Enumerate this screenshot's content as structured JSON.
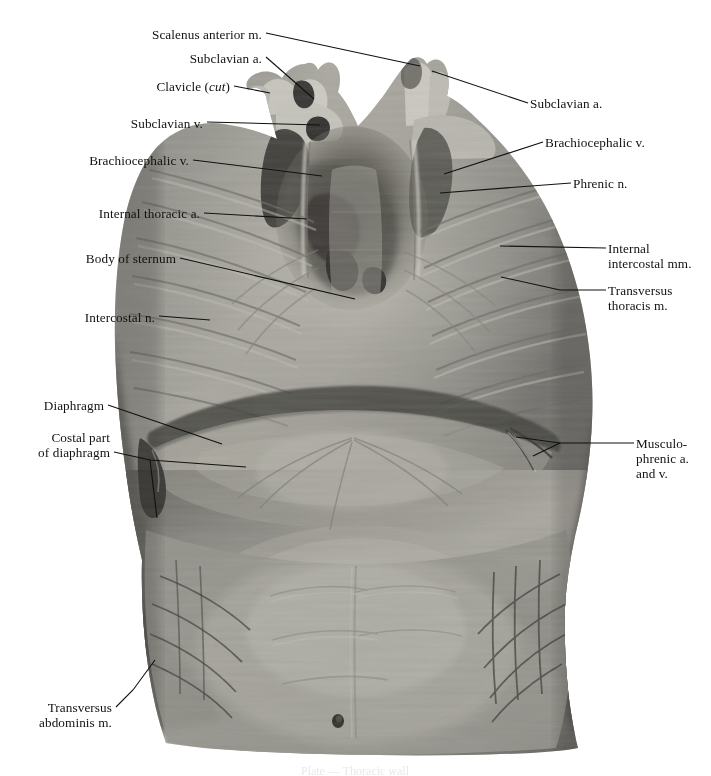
{
  "plate": {
    "type": "anatomical-photograph-plate",
    "view": "Internal (posterior) view of the anterior thoracic and abdominal wall",
    "background_color": "#ffffff",
    "image_region": {
      "x": 113,
      "y": 57,
      "width": 485,
      "height": 698
    },
    "caption": "Plate — Thoracic wall"
  },
  "labels": [
    {
      "id": "scalenus-anterior",
      "text": "Scalenus anterior m.",
      "side": "left",
      "text_x": 262,
      "text_y": 27,
      "leader": [
        [
          266,
          33
        ],
        [
          420,
          66
        ]
      ]
    },
    {
      "id": "subclavian-a-left",
      "text": "Subclavian a.",
      "side": "left",
      "text_x": 262,
      "text_y": 51,
      "leader": [
        [
          266,
          57
        ],
        [
          314,
          99
        ]
      ]
    },
    {
      "id": "clavicle-cut",
      "text": "Clavicle (cut)",
      "italic_part": "cut",
      "side": "left",
      "text_x": 230,
      "text_y": 79,
      "leader": [
        [
          234,
          86
        ],
        [
          270,
          93
        ]
      ]
    },
    {
      "id": "subclavian-v",
      "text": "Subclavian v.",
      "side": "left",
      "text_x": 203,
      "text_y": 116,
      "leader": [
        [
          207,
          122
        ],
        [
          320,
          125
        ]
      ]
    },
    {
      "id": "brachiocephalic-v-left",
      "text": "Brachiocephalic v.",
      "side": "left",
      "text_x": 189,
      "text_y": 153,
      "leader": [
        [
          193,
          160
        ],
        [
          322,
          176
        ]
      ]
    },
    {
      "id": "internal-thoracic-a",
      "text": "Internal thoracic a.",
      "side": "left",
      "text_x": 200,
      "text_y": 206,
      "leader": [
        [
          204,
          213
        ],
        [
          307,
          219
        ]
      ]
    },
    {
      "id": "body-of-sternum",
      "text": "Body of sternum",
      "side": "left",
      "text_x": 176,
      "text_y": 251,
      "leader": [
        [
          180,
          258
        ],
        [
          355,
          299
        ]
      ]
    },
    {
      "id": "intercostal-n",
      "text": "Intercostal n.",
      "side": "left",
      "text_x": 155,
      "text_y": 310,
      "leader": [
        [
          159,
          316
        ],
        [
          210,
          320
        ]
      ]
    },
    {
      "id": "diaphragm",
      "text": "Diaphragm",
      "side": "left",
      "text_x": 104,
      "text_y": 398,
      "leader": [
        [
          108,
          405
        ],
        [
          222,
          444
        ]
      ]
    },
    {
      "id": "costal-part-of-diaphragm",
      "text": "Costal part\nof diaphragm",
      "side": "left",
      "text_x": 110,
      "text_y": 430,
      "leader": [
        [
          114,
          452
        ],
        [
          150,
          460
        ],
        [
          246,
          467
        ]
      ]
    },
    {
      "id": "costal-part-branch",
      "text": "",
      "side": "left",
      "is_branch": true,
      "leader": [
        [
          150,
          460
        ],
        [
          157,
          518
        ]
      ]
    },
    {
      "id": "transversus-abdominis",
      "text": "Transversus\nabdominis m.",
      "side": "left",
      "text_x": 112,
      "text_y": 700,
      "leader": [
        [
          116,
          707
        ],
        [
          133,
          690
        ],
        [
          155,
          660
        ]
      ]
    },
    {
      "id": "subclavian-a-right",
      "text": "Subclavian a.",
      "side": "right",
      "text_x": 530,
      "text_y": 96,
      "leader": [
        [
          528,
          103
        ],
        [
          432,
          71
        ]
      ]
    },
    {
      "id": "brachiocephalic-v-right",
      "text": "Brachiocephalic v.",
      "side": "right",
      "text_x": 545,
      "text_y": 135,
      "leader": [
        [
          543,
          142
        ],
        [
          444,
          174
        ]
      ]
    },
    {
      "id": "phrenic-n",
      "text": "Phrenic n.",
      "side": "right",
      "text_x": 573,
      "text_y": 176,
      "leader": [
        [
          571,
          183
        ],
        [
          440,
          193
        ]
      ]
    },
    {
      "id": "internal-intercostal-mm",
      "text": "Internal\nintercostal mm.",
      "side": "right",
      "text_x": 608,
      "text_y": 241,
      "leader": [
        [
          606,
          248
        ],
        [
          500,
          246
        ]
      ]
    },
    {
      "id": "transversus-thoracis-m",
      "text": "Transversus\nthoracis m.",
      "side": "right",
      "text_x": 608,
      "text_y": 283,
      "leader": [
        [
          606,
          290
        ],
        [
          560,
          290
        ],
        [
          501,
          277
        ]
      ]
    },
    {
      "id": "musculophrenic",
      "text": "Musculo-\nphrenic a.\nand v.",
      "side": "right",
      "text_x": 636,
      "text_y": 436,
      "leader": [
        [
          634,
          443
        ],
        [
          560,
          443
        ],
        [
          516,
          437
        ]
      ]
    },
    {
      "id": "musculophrenic-branch",
      "text": "",
      "side": "right",
      "is_branch": true,
      "leader": [
        [
          560,
          443
        ],
        [
          533,
          456
        ]
      ]
    }
  ],
  "colors": {
    "leader_line": "#111111",
    "label_text": "#111111",
    "page_background": "#ffffff",
    "specimen_mid": "#8e8d88",
    "specimen_light": "#b9b7b0",
    "specimen_dark": "#4b4a46",
    "specimen_shadow": "#232220"
  }
}
